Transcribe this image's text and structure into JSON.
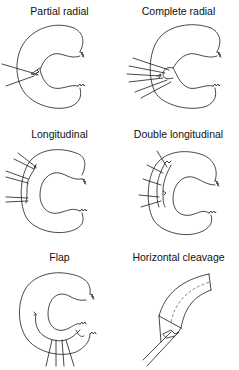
{
  "diagram": {
    "panels": [
      {
        "id": "partial-radial",
        "label": "Partial radial"
      },
      {
        "id": "complete-radial",
        "label": "Complete radial"
      },
      {
        "id": "longitudinal",
        "label": "Longitudinal"
      },
      {
        "id": "double-longitudinal",
        "label": "Double longitudinal"
      },
      {
        "id": "flap",
        "label": "Flap"
      },
      {
        "id": "horizontal-cleavage",
        "label": "Horizontal cleavage"
      }
    ],
    "colors": {
      "line": "#1a1a1a",
      "background": "#ffffff"
    }
  }
}
